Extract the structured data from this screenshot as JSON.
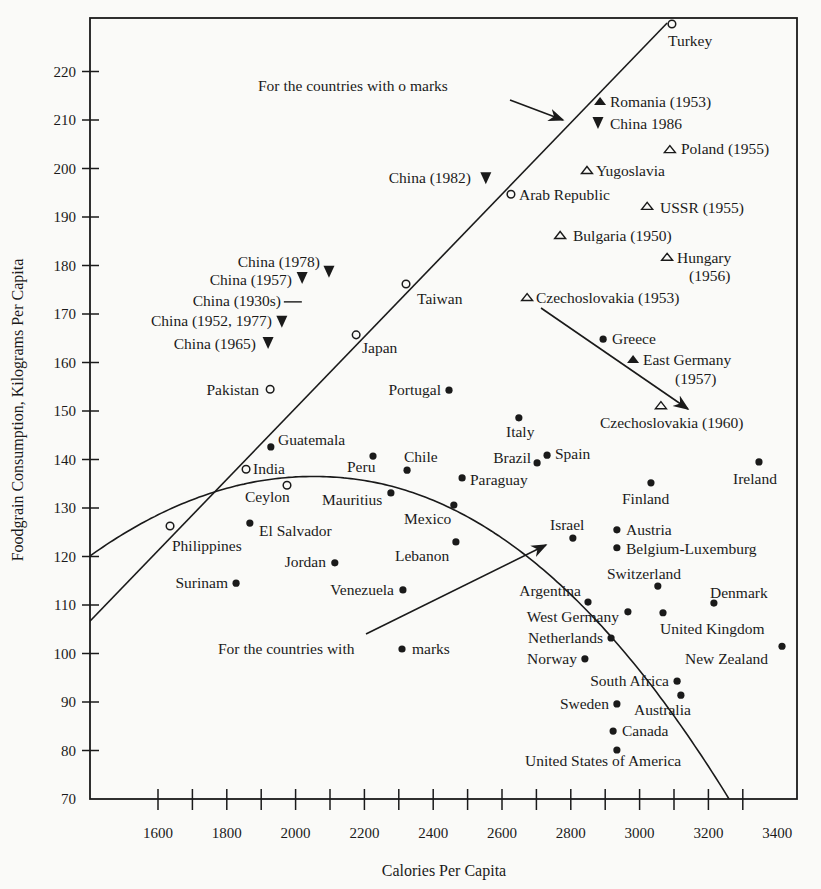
{
  "chart_data": {
    "type": "scatter",
    "title": "",
    "xlabel": "Calories Per Capita",
    "ylabel": "Foodgrain Consumption, Kilograms Per Capita",
    "xlim": [
      1400,
      3450
    ],
    "ylim": [
      70,
      230
    ],
    "x_ticks_minor_step": 100,
    "x_tick_labels": [
      "1600",
      "1800",
      "2000",
      "2200",
      "2400",
      "2600",
      "2800",
      "3000",
      "3200",
      "3400"
    ],
    "y_tick_labels": [
      "70",
      "80",
      "90",
      "100",
      "110",
      "120",
      "130",
      "140",
      "150",
      "160",
      "170",
      "180",
      "190",
      "200",
      "210",
      "220"
    ],
    "grid": false,
    "legend": "none (marker meaning given by annotations)",
    "marker_types": {
      "open_circle": "o",
      "filled_circle": "●",
      "filled_triangle_up": "▲",
      "open_triangle_up": "△",
      "filled_triangle_down": "▼",
      "dash": "—"
    },
    "points": [
      {
        "label": "Turkey",
        "x": 3094,
        "y": 229.8,
        "marker": "open_circle",
        "lx": 668,
        "ly": 46,
        "anchor": "start"
      },
      {
        "label": "Romania (1953)",
        "x": 2885,
        "y": 213.9,
        "marker": "filled_triangle_up",
        "lx": 610,
        "ly": 107,
        "anchor": "start"
      },
      {
        "label": "China 1986",
        "x": 2879,
        "y": 209.4,
        "marker": "filled_triangle_down",
        "lx": 610,
        "ly": 129,
        "anchor": "start"
      },
      {
        "label": "Poland (1955)",
        "x": 3088,
        "y": 204,
        "marker": "open_triangle_up",
        "lx": 681,
        "ly": 154,
        "anchor": "start"
      },
      {
        "label": "Yugoslavia",
        "x": 2847,
        "y": 199.7,
        "marker": "open_triangle_up",
        "lx": 596,
        "ly": 176,
        "anchor": "start"
      },
      {
        "label": "Arab Republic",
        "x": 2626,
        "y": 194.7,
        "marker": "open_circle",
        "lx": 519,
        "ly": 200,
        "anchor": "start"
      },
      {
        "label": "China (1982)",
        "x": 2553,
        "y": 198,
        "marker": "filled_triangle_down",
        "lx": 471,
        "ly": 183,
        "anchor": "end"
      },
      {
        "label": "USSR (1955)",
        "x": 3022,
        "y": 192.3,
        "marker": "open_triangle_up",
        "lx": 660,
        "ly": 213,
        "anchor": "start"
      },
      {
        "label": "Bulgaria (1950)",
        "x": 2769,
        "y": 186.3,
        "marker": "open_triangle_up",
        "lx": 573,
        "ly": 241,
        "anchor": "start"
      },
      {
        "label": "Hungary",
        "x": 3080,
        "y": 181.8,
        "marker": "open_triangle_up",
        "lx": 677,
        "ly": 263,
        "anchor": "start",
        "line2": "(1956)",
        "l2x": 689,
        "l2y": 281
      },
      {
        "label": "Czechoslovakia (1953)",
        "x": 2673,
        "y": 173.5,
        "marker": "open_triangle_up",
        "lx": 536,
        "ly": 303,
        "anchor": "start"
      },
      {
        "label": "Greece",
        "x": 2894,
        "y": 164.8,
        "marker": "filled_circle",
        "lx": 612,
        "ly": 344,
        "anchor": "start"
      },
      {
        "label": "East Germany",
        "x": 2981,
        "y": 160.7,
        "marker": "filled_triangle_up",
        "lx": 643,
        "ly": 365,
        "anchor": "start",
        "line2": "(1957)",
        "l2x": 675,
        "l2y": 384
      },
      {
        "label": "Czechoslovakia (1960)",
        "x": 3062,
        "y": 151.2,
        "marker": "open_triangle_up",
        "lx": 600,
        "ly": 428,
        "anchor": "start"
      },
      {
        "label": "Taiwan",
        "x": 2321,
        "y": 176.2,
        "marker": "open_circle",
        "lx": 417,
        "ly": 304,
        "anchor": "start"
      },
      {
        "label": "Japan",
        "x": 2176,
        "y": 165.7,
        "marker": "open_circle",
        "lx": 362,
        "ly": 353,
        "anchor": "start"
      },
      {
        "label": "China (1978)",
        "x": 2097,
        "y": 178.7,
        "marker": "filled_triangle_down",
        "lx": 320,
        "ly": 267,
        "anchor": "end"
      },
      {
        "label": "China (1957)",
        "x": 2019,
        "y": 177.4,
        "marker": "filled_triangle_down",
        "lx": 292,
        "ly": 285,
        "anchor": "end"
      },
      {
        "label": "China (1930s)",
        "x": 1992,
        "y": 172.5,
        "marker": "dash",
        "lx": 281,
        "ly": 306,
        "anchor": "end"
      },
      {
        "label": "China (1952, 1977)",
        "x": 1960,
        "y": 168.4,
        "marker": "filled_triangle_down",
        "lx": 272,
        "ly": 326,
        "anchor": "end"
      },
      {
        "label": "China (1965)",
        "x": 1920,
        "y": 164,
        "marker": "filled_triangle_down",
        "lx": 256,
        "ly": 349,
        "anchor": "end"
      },
      {
        "label": "Pakistan",
        "x": 1926,
        "y": 154.5,
        "marker": "open_circle",
        "lx": 259,
        "ly": 395,
        "anchor": "end"
      },
      {
        "label": "Portugal",
        "x": 2446,
        "y": 154.3,
        "marker": "filled_circle",
        "lx": 441,
        "ly": 395,
        "anchor": "end"
      },
      {
        "label": "Italy",
        "x": 2649,
        "y": 148.6,
        "marker": "filled_circle",
        "lx": 506,
        "ly": 437,
        "anchor": "start"
      },
      {
        "label": "Spain",
        "x": 2731,
        "y": 140.9,
        "marker": "filled_circle",
        "lx": 555,
        "ly": 459,
        "anchor": "start"
      },
      {
        "label": "Brazil",
        "x": 2702,
        "y": 139.3,
        "marker": "filled_circle",
        "lx": 531,
        "ly": 463,
        "anchor": "end"
      },
      {
        "label": "Paraguay",
        "x": 2484,
        "y": 136.2,
        "marker": "filled_circle",
        "lx": 470,
        "ly": 485,
        "anchor": "start"
      },
      {
        "label": "Chile",
        "x": 2324,
        "y": 137.8,
        "marker": "filled_circle",
        "lx": 404,
        "ly": 462,
        "anchor": "start"
      },
      {
        "label": "Peru",
        "x": 2225,
        "y": 140.7,
        "marker": "filled_circle",
        "lx": 347,
        "ly": 472,
        "anchor": "start"
      },
      {
        "label": "Guatemala",
        "x": 1928,
        "y": 142.6,
        "marker": "filled_circle",
        "lx": 278,
        "ly": 445,
        "anchor": "start"
      },
      {
        "label": "India",
        "x": 1856,
        "y": 138,
        "marker": "open_circle",
        "lx": 253,
        "ly": 474,
        "anchor": "start"
      },
      {
        "label": "Ceylon",
        "x": 1975,
        "y": 134.7,
        "marker": "open_circle",
        "lx": 245,
        "ly": 502,
        "anchor": "start"
      },
      {
        "label": "Mauritius",
        "x": 2277,
        "y": 133.1,
        "marker": "filled_circle",
        "lx": 322,
        "ly": 505,
        "anchor": "start"
      },
      {
        "label": "Mexico",
        "x": 2460,
        "y": 130.6,
        "marker": "filled_circle",
        "lx": 404,
        "ly": 524,
        "anchor": "start"
      },
      {
        "label": "Lebanon",
        "x": 2466,
        "y": 123,
        "marker": "filled_circle",
        "lx": 395,
        "ly": 561,
        "anchor": "start"
      },
      {
        "label": "Israel",
        "x": 2806,
        "y": 123.8,
        "marker": "filled_circle",
        "lx": 550,
        "ly": 530,
        "anchor": "start"
      },
      {
        "label": "Philippines",
        "x": 1635,
        "y": 126.3,
        "marker": "open_circle",
        "lx": 172,
        "ly": 551,
        "anchor": "start"
      },
      {
        "label": "El Salvador",
        "x": 1867,
        "y": 126.9,
        "marker": "filled_circle",
        "lx": 259,
        "ly": 536,
        "anchor": "start"
      },
      {
        "label": "Jordan",
        "x": 2114,
        "y": 118.7,
        "marker": "filled_circle",
        "lx": 326,
        "ly": 567,
        "anchor": "end"
      },
      {
        "label": "Surinam",
        "x": 1827,
        "y": 114.5,
        "marker": "filled_circle",
        "lx": 228,
        "ly": 588,
        "anchor": "end"
      },
      {
        "label": "Venezuela",
        "x": 2312,
        "y": 113.1,
        "marker": "filled_circle",
        "lx": 394,
        "ly": 595,
        "anchor": "end"
      },
      {
        "label": "Finland",
        "x": 3033,
        "y": 135.2,
        "marker": "filled_circle",
        "lx": 622,
        "ly": 504,
        "anchor": "start"
      },
      {
        "label": "Ireland",
        "x": 3347,
        "y": 139.5,
        "marker": "filled_circle",
        "lx": 733,
        "ly": 484,
        "anchor": "start"
      },
      {
        "label": "Austria",
        "x": 2934,
        "y": 125.5,
        "marker": "filled_circle",
        "lx": 626,
        "ly": 535,
        "anchor": "start"
      },
      {
        "label": "Belgium-Luxemburg",
        "x": 2934,
        "y": 121.8,
        "marker": "filled_circle",
        "lx": 626,
        "ly": 554,
        "anchor": "start"
      },
      {
        "label": "Switzerland",
        "x": 3053,
        "y": 113.9,
        "marker": "filled_circle",
        "lx": 607,
        "ly": 579,
        "anchor": "start"
      },
      {
        "label": "Denmark",
        "x": 3216,
        "y": 110.4,
        "marker": "filled_circle",
        "lx": 710,
        "ly": 598,
        "anchor": "start"
      },
      {
        "label": "Argentina",
        "x": 2850,
        "y": 110.6,
        "marker": "filled_circle",
        "lx": 581,
        "ly": 596,
        "anchor": "end"
      },
      {
        "label": "West Germany",
        "x": 2966,
        "y": 108.6,
        "marker": "filled_circle",
        "lx": 619,
        "ly": 622,
        "anchor": "end"
      },
      {
        "label": "United Kingdom",
        "x": 3068,
        "y": 108.4,
        "marker": "filled_circle",
        "lx": 660,
        "ly": 634,
        "anchor": "start"
      },
      {
        "label": "Netherlands",
        "x": 2917,
        "y": 103.2,
        "marker": "filled_circle",
        "lx": 603,
        "ly": 643,
        "anchor": "end"
      },
      {
        "label": "New Zealand",
        "x": 3414,
        "y": 101.5,
        "marker": "filled_circle",
        "lx": 685,
        "ly": 664,
        "anchor": "start"
      },
      {
        "label": "Norway",
        "x": 2841,
        "y": 98.9,
        "marker": "filled_circle",
        "lx": 577,
        "ly": 664,
        "anchor": "end"
      },
      {
        "label": "South Africa",
        "x": 3109,
        "y": 94.3,
        "marker": "filled_circle",
        "lx": 669,
        "ly": 686,
        "anchor": "end"
      },
      {
        "label": "Australia",
        "x": 3120,
        "y": 91.4,
        "marker": "filled_circle",
        "lx": 634,
        "ly": 715,
        "anchor": "start"
      },
      {
        "label": "Sweden",
        "x": 2934,
        "y": 89.6,
        "marker": "filled_circle",
        "lx": 609,
        "ly": 709,
        "anchor": "end"
      },
      {
        "label": "Canada",
        "x": 2923,
        "y": 84,
        "marker": "filled_circle",
        "lx": 622,
        "ly": 736,
        "anchor": "start"
      },
      {
        "label": "United States of America",
        "x": 2934,
        "y": 80.1,
        "marker": "filled_circle",
        "lx": 525,
        "ly": 766,
        "anchor": "start"
      }
    ],
    "fit_lines": [
      {
        "name": "linear fit for countries with o marks",
        "type": "line",
        "from": [
          1400,
          106.5
        ],
        "to": [
          3080,
          230
        ]
      },
      {
        "name": "quadratic fit for countries with ● marks",
        "type": "curve",
        "from": [
          1400,
          120
        ],
        "peak": [
          2050,
          136.5
        ],
        "to": [
          3260,
          70
        ]
      }
    ],
    "annotations": [
      {
        "text": "For the countries with o marks",
        "tx": 258,
        "ty": 91,
        "arrow_from": [
          510,
          100
        ],
        "arrow_to": [
          563,
          120
        ]
      },
      {
        "text_before": "For the countries with",
        "text_after": "marks",
        "tx": 218,
        "ty": 654,
        "bullet_x": 402,
        "arrow_from": [
          366,
          634
        ],
        "arrow_to": [
          546,
          545
        ]
      },
      {
        "text": "",
        "arrow_from": [
          541,
          308
        ],
        "arrow_to": [
          688,
          409
        ],
        "note": "Czechoslovakia 1953 to 1960 arrow"
      }
    ]
  },
  "axes": {
    "x_title": "Calories Per Capita",
    "y_title": "Foodgrain Consumption, Kilograms Per Capita"
  }
}
